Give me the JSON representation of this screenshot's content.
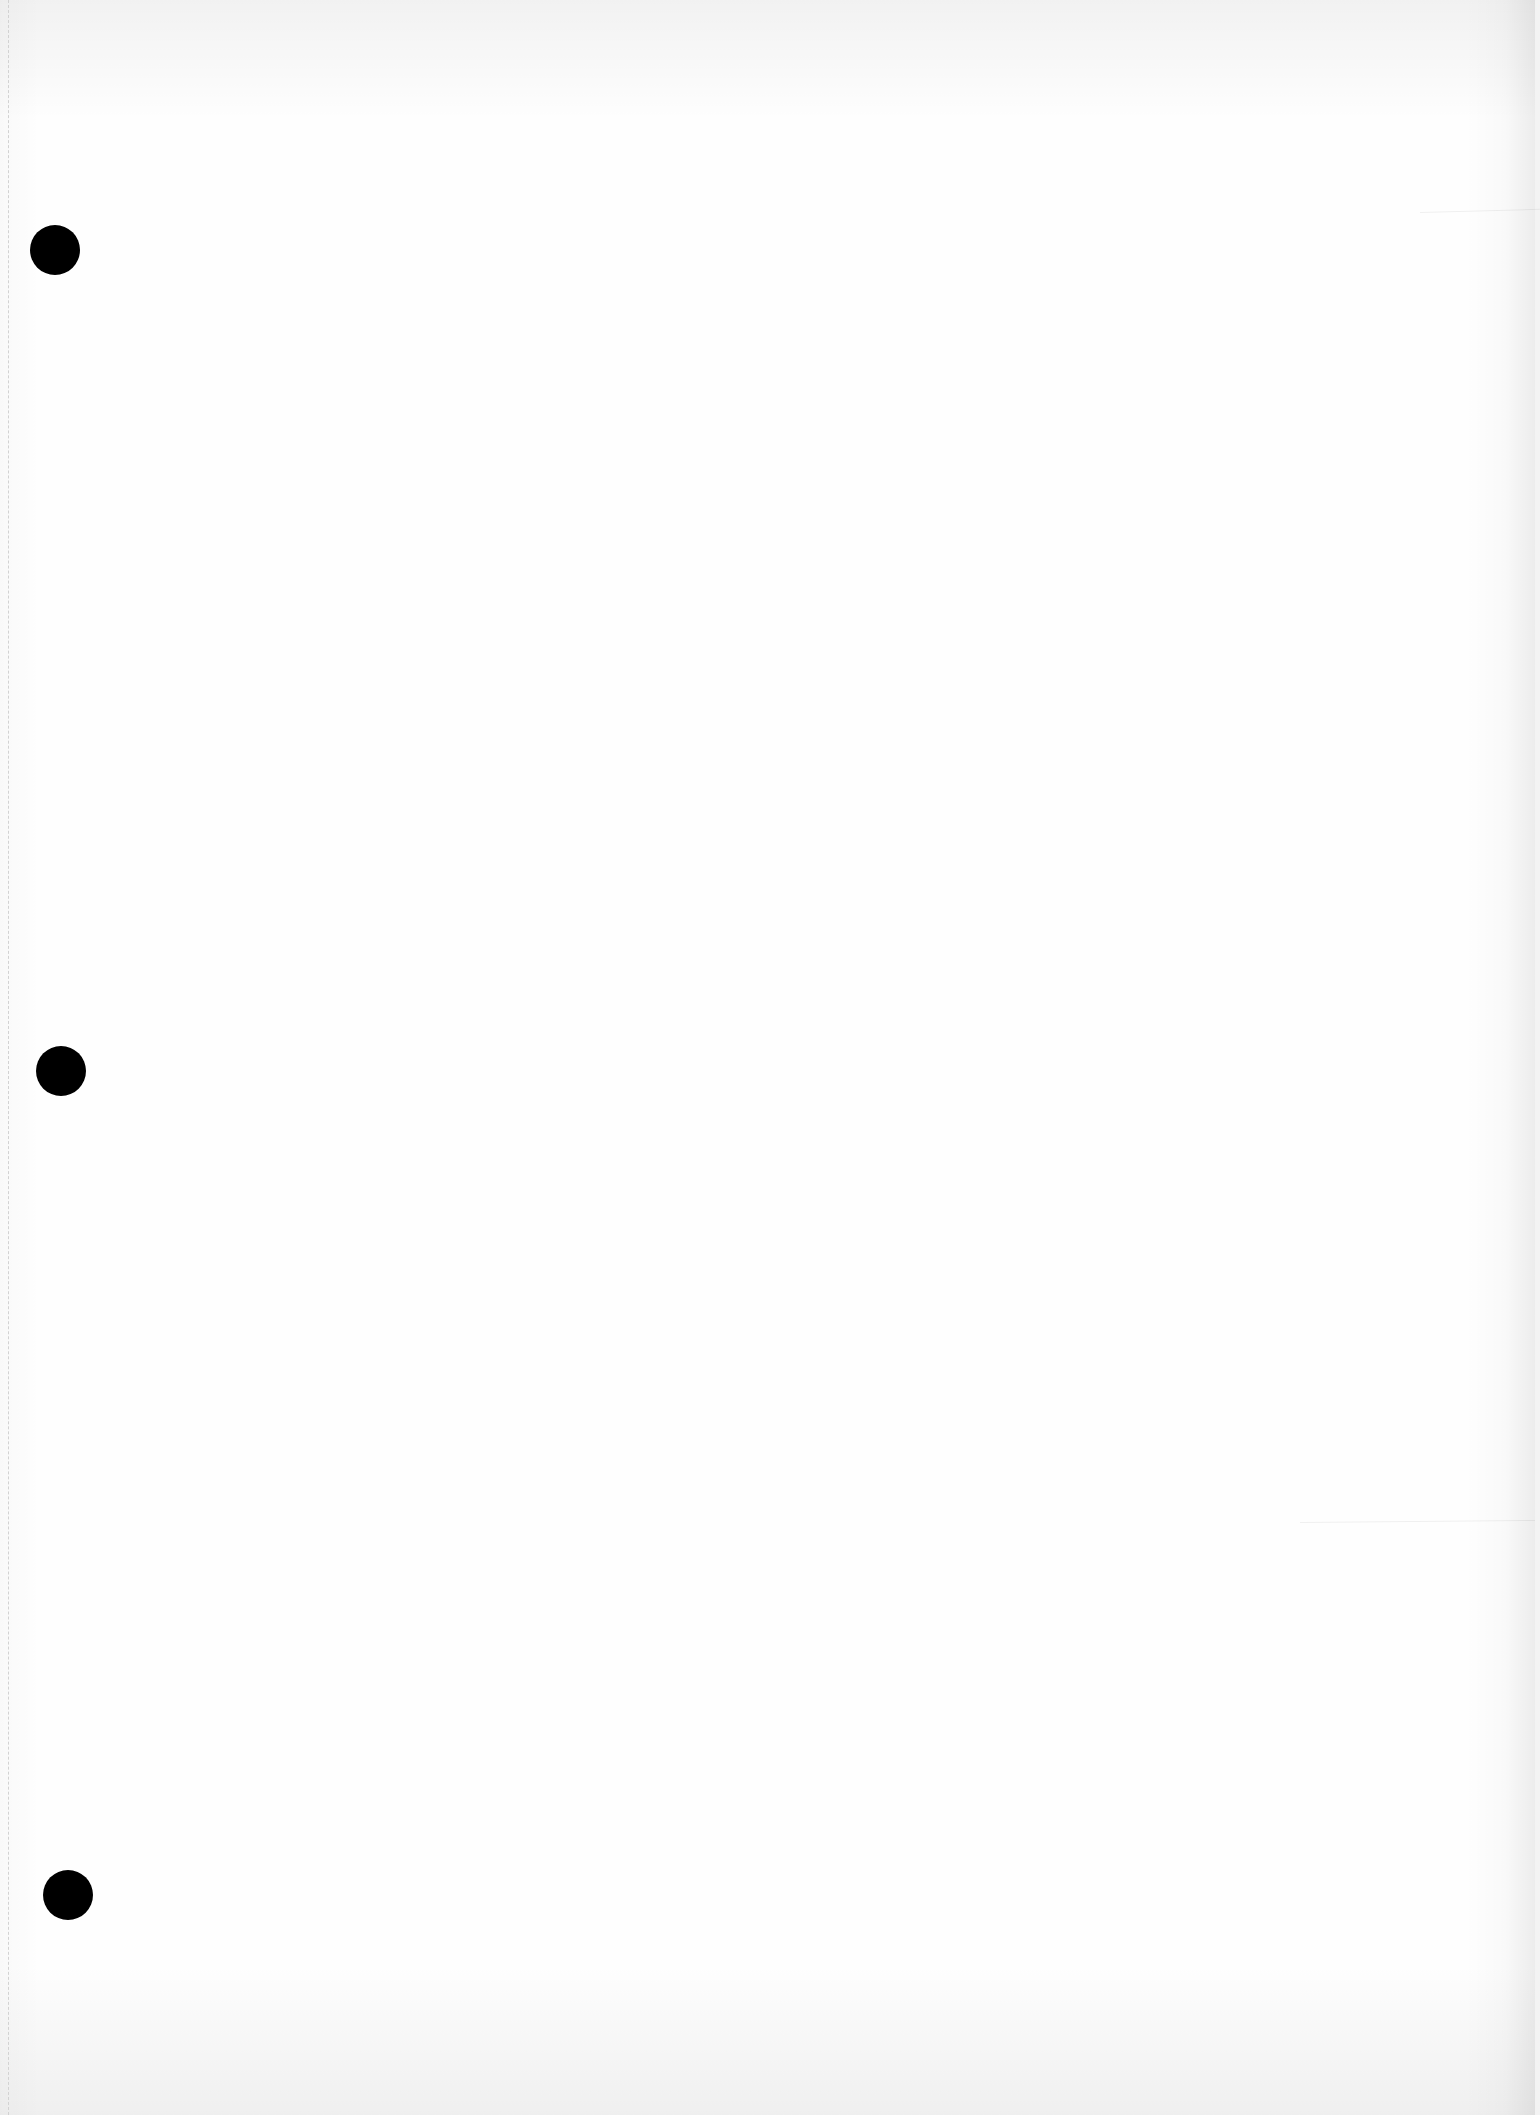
{
  "document": {
    "description": "Blank scanned sheet of paper with three punched binder holes",
    "page": {
      "width": 1535,
      "height": 2115,
      "background_color": "#fefefe",
      "content_text": ""
    },
    "punch_holes": [
      {
        "cx": 55,
        "cy": 250,
        "diameter": 50,
        "color": "#000000"
      },
      {
        "cx": 61,
        "cy": 1071,
        "diameter": 50,
        "color": "#000000"
      },
      {
        "cx": 68,
        "cy": 1895,
        "diameter": 50,
        "color": "#000000"
      }
    ],
    "artifacts": {
      "left_perforation_line": true,
      "creases": [
        {
          "x": 1420,
          "y": 212,
          "length": 120,
          "angle_deg": -1.5
        },
        {
          "x": 1300,
          "y": 1522,
          "length": 235,
          "angle_deg": -0.5
        }
      ]
    }
  }
}
